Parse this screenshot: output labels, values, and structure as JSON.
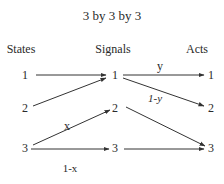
{
  "title": "3 by 3 by 3",
  "columns": {
    "states": "States",
    "signals": "Signals",
    "acts": "Acts"
  },
  "nodes": {
    "states": [
      "1",
      "2",
      "3"
    ],
    "signals": [
      "1",
      "2",
      "3"
    ],
    "acts": [
      "1",
      "2",
      "3"
    ]
  },
  "edges": [
    {
      "from": "state-1",
      "to": "signal-1",
      "label": ""
    },
    {
      "from": "state-2",
      "to": "signal-1",
      "label": ""
    },
    {
      "from": "state-3",
      "to": "signal-2",
      "label": "x"
    },
    {
      "from": "state-3",
      "to": "signal-3",
      "label": "1-x"
    },
    {
      "from": "signal-1",
      "to": "act-1",
      "label": "y"
    },
    {
      "from": "signal-1",
      "to": "act-2",
      "label": "1-y"
    },
    {
      "from": "signal-2",
      "to": "act-3",
      "label": ""
    },
    {
      "from": "signal-3",
      "to": "act-3",
      "label": ""
    }
  ],
  "edge_labels": {
    "x": "x",
    "one_minus_x": "1-x",
    "y": "y",
    "one_minus_y": "1-y"
  },
  "colors": {
    "line": "#333333",
    "text": "#2a2a2a",
    "background": "#ffffff"
  }
}
